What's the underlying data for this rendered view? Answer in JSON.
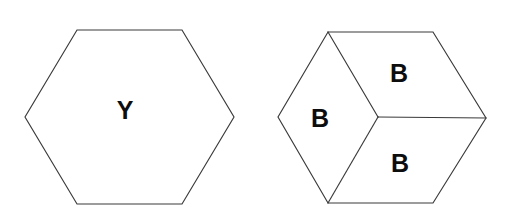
{
  "figure": {
    "background_color": "#ffffff",
    "line_color": "#3a3a3a",
    "label_color": "#0d0d0d",
    "canvas": {
      "width": 513,
      "height": 216
    }
  },
  "shapes": [
    {
      "id": "left-hexagon",
      "name": "plain-hexagon",
      "kind": "hexagon",
      "orientation": "flat-top",
      "subdivided": false,
      "outline_points": "77,30 182,30 234,117 182,204 77,204 25,117",
      "labels": [
        {
          "id": "label-y",
          "text": "Y",
          "x": 125,
          "y": 110
        }
      ],
      "internal_edges": []
    },
    {
      "id": "right-hexagon",
      "name": "subdivided-hexagon-cube",
      "kind": "hexagon",
      "orientation": "flat-top",
      "subdivided": true,
      "subdivision": "three-rhombi-tumbling-blocks",
      "outline_points": "328,32 433,32 486,118 433,203 328,203 278,117",
      "center_vertex": {
        "x": 378,
        "y": 117
      },
      "internal_edges": [
        {
          "id": "edge-center-to-top-left",
          "d": "M 378 117 L 328 32"
        },
        {
          "id": "edge-center-to-right",
          "d": "M 378 117 L 486 118"
        },
        {
          "id": "edge-center-to-bottom-left",
          "d": "M 378 117 L 328 203"
        }
      ],
      "labels": [
        {
          "id": "label-b-top",
          "text": "B",
          "x": 399,
          "y": 73
        },
        {
          "id": "label-b-left",
          "text": "B",
          "x": 320,
          "y": 118
        },
        {
          "id": "label-b-bottom",
          "text": "B",
          "x": 400,
          "y": 163
        }
      ]
    }
  ]
}
